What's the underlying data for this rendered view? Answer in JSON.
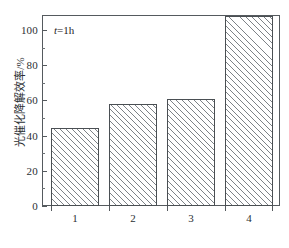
{
  "figure": {
    "background_color": "#ffffff",
    "frame_color": "#555a5e",
    "bar_edge_color": "#4a4f53",
    "hatch_color": "#7d8287"
  },
  "annotation": {
    "symbol": "t",
    "rest": "=1h",
    "full": "t=1h"
  },
  "axes": {
    "ylabel": "光催化降解效率/%",
    "xlabel": "",
    "ytick_labels": [
      "0",
      "20",
      "40",
      "60",
      "80",
      "100"
    ],
    "xtick_labels": [
      "1",
      "2",
      "3",
      "4"
    ]
  },
  "chart_data": {
    "type": "bar",
    "title": "",
    "xlabel": "",
    "ylabel": "光催化降解效率/%",
    "categories": [
      "1",
      "2",
      "3",
      "4"
    ],
    "values": [
      41,
      53.5,
      56.5,
      100
    ],
    "ylim": [
      0,
      100
    ],
    "yticks": [
      0,
      20,
      40,
      60,
      80,
      100
    ],
    "yminor_ticks": [
      10,
      30,
      50,
      70,
      90
    ],
    "grid": false,
    "legend": null,
    "annotations": [
      {
        "text": "t=1h",
        "x": "upper-left inside axes"
      }
    ],
    "bar_style": {
      "fill": "white",
      "hatch": "///",
      "hatch_color": "#7d8287",
      "edge_color": "#4a4f53"
    }
  }
}
